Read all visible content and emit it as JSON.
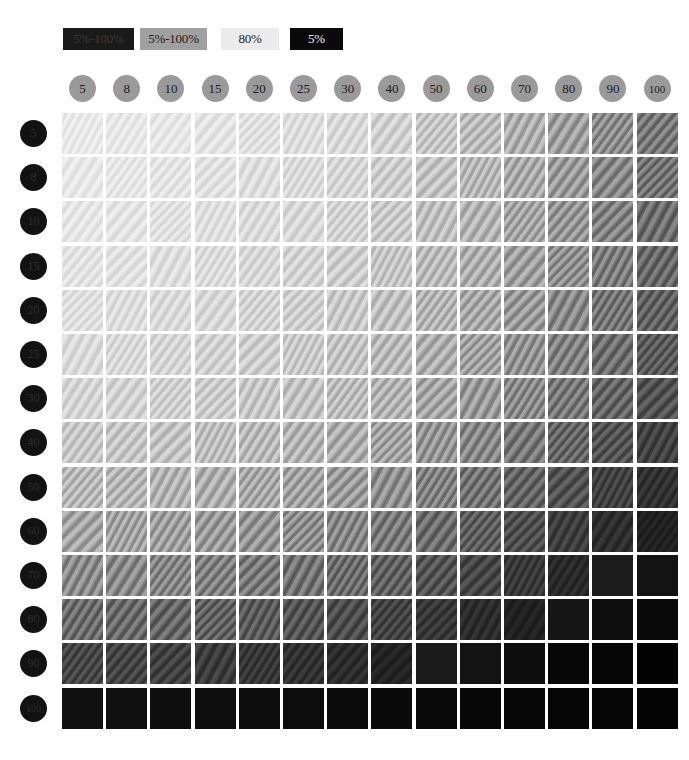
{
  "legend": {
    "items": [
      {
        "label": "5%-100%",
        "bg": "#1a1a1a",
        "fg": "#3a3a3a",
        "x": 63,
        "y": 28,
        "w": 71,
        "h": 22
      },
      {
        "label": "5%-100%",
        "bg": "#a0a0a0",
        "fg": "#1c1c1c",
        "x": 140,
        "y": 28,
        "w": 67,
        "h": 22
      },
      {
        "label": "80%",
        "bg": "#ebebeb",
        "fg": "#1c1c1c",
        "x": 221,
        "y": 28,
        "w": 58,
        "h": 22
      },
      {
        "label": "5%",
        "bg": "#0a0a0a",
        "fg": "#f2f2f2",
        "x": 290,
        "y": 28,
        "w": 53,
        "h": 22
      }
    ]
  },
  "axes": {
    "column_header_label": "screen ruling",
    "row_header_label": "tone value",
    "columns": [
      "5",
      "8",
      "10",
      "15",
      "20",
      "25",
      "30",
      "40",
      "50",
      "60",
      "70",
      "80",
      "90",
      "100"
    ],
    "rows": [
      "5",
      "8",
      "10",
      "15",
      "20",
      "25",
      "30",
      "40",
      "50",
      "60",
      "70",
      "80",
      "90",
      "100"
    ]
  },
  "chart_data": {
    "type": "heatmap",
    "title": "",
    "xlabel": "",
    "ylabel": "",
    "categories_x": [
      "5",
      "8",
      "10",
      "15",
      "20",
      "25",
      "30",
      "40",
      "50",
      "60",
      "70",
      "80",
      "90",
      "100"
    ],
    "categories_y": [
      "5",
      "8",
      "10",
      "15",
      "20",
      "25",
      "30",
      "40",
      "50",
      "60",
      "70",
      "80",
      "90",
      "100"
    ],
    "legend_position": "top-left",
    "grid": false,
    "colorscale": "grayscale-dark-high",
    "note": "Each cell renders a gray density patch with a diagonal moire texture; darkness increases left-to-right and top-to-bottom.",
    "values": [
      [
        232,
        230,
        229,
        226,
        223,
        219,
        214,
        206,
        196,
        184,
        170,
        154,
        136,
        116
      ],
      [
        230,
        228,
        226,
        223,
        220,
        216,
        211,
        203,
        192,
        180,
        166,
        150,
        131,
        111
      ],
      [
        228,
        226,
        224,
        221,
        217,
        213,
        208,
        199,
        188,
        176,
        161,
        145,
        126,
        106
      ],
      [
        225,
        223,
        220,
        217,
        213,
        209,
        203,
        194,
        183,
        170,
        155,
        139,
        120,
        100
      ],
      [
        221,
        219,
        216,
        213,
        209,
        204,
        198,
        189,
        177,
        164,
        149,
        132,
        113,
        94
      ],
      [
        216,
        214,
        211,
        207,
        203,
        198,
        192,
        182,
        170,
        157,
        142,
        125,
        106,
        87
      ],
      [
        210,
        208,
        205,
        201,
        196,
        191,
        185,
        175,
        162,
        149,
        133,
        116,
        97,
        79
      ],
      [
        197,
        195,
        192,
        187,
        182,
        176,
        169,
        158,
        145,
        131,
        115,
        98,
        80,
        63
      ],
      [
        181,
        179,
        175,
        170,
        164,
        158,
        151,
        139,
        125,
        111,
        96,
        79,
        62,
        47
      ],
      [
        161,
        159,
        155,
        150,
        144,
        137,
        130,
        118,
        104,
        90,
        75,
        59,
        44,
        32
      ],
      [
        135,
        133,
        129,
        124,
        118,
        111,
        104,
        93,
        80,
        67,
        54,
        40,
        28,
        19
      ],
      [
        104,
        102,
        98,
        93,
        87,
        81,
        74,
        64,
        53,
        42,
        32,
        22,
        14,
        9
      ],
      [
        67,
        65,
        62,
        57,
        52,
        47,
        42,
        34,
        26,
        19,
        13,
        8,
        5,
        3
      ],
      [
        16,
        16,
        15,
        14,
        13,
        12,
        11,
        10,
        9,
        8,
        7,
        6,
        5,
        4
      ]
    ]
  },
  "layout": {
    "grid_left": 62,
    "grid_top": 113,
    "cell_w": 44.2,
    "cell_h": 44.2,
    "cell_size": 41,
    "col_head_y": 75,
    "row_head_x": 20
  }
}
